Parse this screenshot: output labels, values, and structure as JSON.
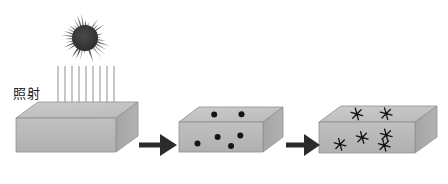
{
  "figure": {
    "background_color": "#ffffff",
    "width": 448,
    "height": 184
  },
  "labels": {
    "irradiation": "照射"
  },
  "colors": {
    "block_top": "#c3c3c3",
    "block_front": "#b8b8b8",
    "block_side": "#a8a8a8",
    "block_outline": "#8f8f8f",
    "sun": "#3a3a3a",
    "sun_core": "#2e2e2e",
    "ray": "#9a9a9a",
    "ray_head": "#1c1c1c",
    "arrow": "#2b2b2b",
    "dot": "#141414",
    "star": "#141414"
  },
  "sun": {
    "name": "sunburst",
    "center_x": 85,
    "center_y": 38,
    "core_radius": 13,
    "spike_count": 34,
    "spike_length_min": 13,
    "spike_length_max": 26
  },
  "rays": {
    "name": "irradiation-rays",
    "count": 9,
    "start_y": 66,
    "end_y": 125,
    "x_positions": [
      58,
      65,
      72,
      79,
      86,
      93,
      100,
      107,
      114
    ],
    "head_size": 4
  },
  "blocks": [
    {
      "id": "block-1",
      "name": "untreated-sample-block",
      "caption": "",
      "origin_x": 16,
      "origin_y": 118,
      "width": 100,
      "depth_x": 22,
      "depth_y": -16,
      "height": 34,
      "markers": {
        "type": "none",
        "items": []
      }
    },
    {
      "id": "block-2",
      "name": "dotted-sample-block",
      "caption": "",
      "origin_x": 179,
      "origin_y": 122,
      "width": 84,
      "depth_x": 20,
      "depth_y": -15,
      "height": 30,
      "markers": {
        "type": "dot",
        "radius": 3,
        "items": [
          {
            "face": "top",
            "x": 0.3,
            "y": 0.5
          },
          {
            "face": "top",
            "x": 0.62,
            "y": 0.48
          },
          {
            "face": "front",
            "x": 0.22,
            "y": 0.72
          },
          {
            "face": "front",
            "x": 0.46,
            "y": 0.5
          },
          {
            "face": "front",
            "x": 0.73,
            "y": 0.45
          },
          {
            "face": "front",
            "x": 0.62,
            "y": 0.8
          }
        ]
      }
    },
    {
      "id": "block-3",
      "name": "starred-sample-block",
      "caption": "",
      "origin_x": 319,
      "origin_y": 122,
      "width": 96,
      "depth_x": 22,
      "depth_y": -16,
      "height": 31,
      "markers": {
        "type": "star",
        "radius": 6,
        "points": 6,
        "items": [
          {
            "face": "top",
            "x": 0.28,
            "y": 0.5
          },
          {
            "face": "top",
            "x": 0.58,
            "y": 0.48
          },
          {
            "face": "front",
            "x": 0.22,
            "y": 0.72
          },
          {
            "face": "front",
            "x": 0.45,
            "y": 0.5
          },
          {
            "face": "front",
            "x": 0.7,
            "y": 0.42
          },
          {
            "face": "front",
            "x": 0.68,
            "y": 0.75
          }
        ]
      }
    }
  ],
  "arrows": [
    {
      "id": "arrow-1",
      "name": "process-arrow-1",
      "from_x": 139,
      "to_x": 177,
      "y": 145,
      "shaft_thickness": 5,
      "head_length": 17,
      "head_half_width": 11
    },
    {
      "id": "arrow-2",
      "name": "process-arrow-2",
      "from_x": 286,
      "to_x": 320,
      "y": 145,
      "shaft_thickness": 5,
      "head_length": 16,
      "head_half_width": 11
    }
  ]
}
